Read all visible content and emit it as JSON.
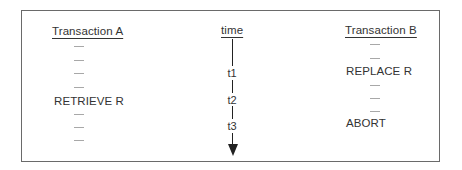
{
  "diagram": {
    "columns": {
      "transaction_a": {
        "header": "Transaction A",
        "rows": [
          "—",
          "—",
          "—",
          "—",
          "RETRIEVE R",
          "—",
          "—",
          "—"
        ]
      },
      "time": {
        "header": "time",
        "markers": [
          "t1",
          "t2",
          "t3"
        ],
        "arrow": "down-arrow"
      },
      "transaction_b": {
        "header": "Transaction B",
        "rows": [
          "—",
          "—",
          "REPLACE R",
          "—",
          "—",
          "—",
          "ABORT"
        ]
      }
    },
    "colors": {
      "border": "#6a6a6a",
      "text": "#333333",
      "arrow": "#222222",
      "dash": "#a8a8a8"
    }
  }
}
